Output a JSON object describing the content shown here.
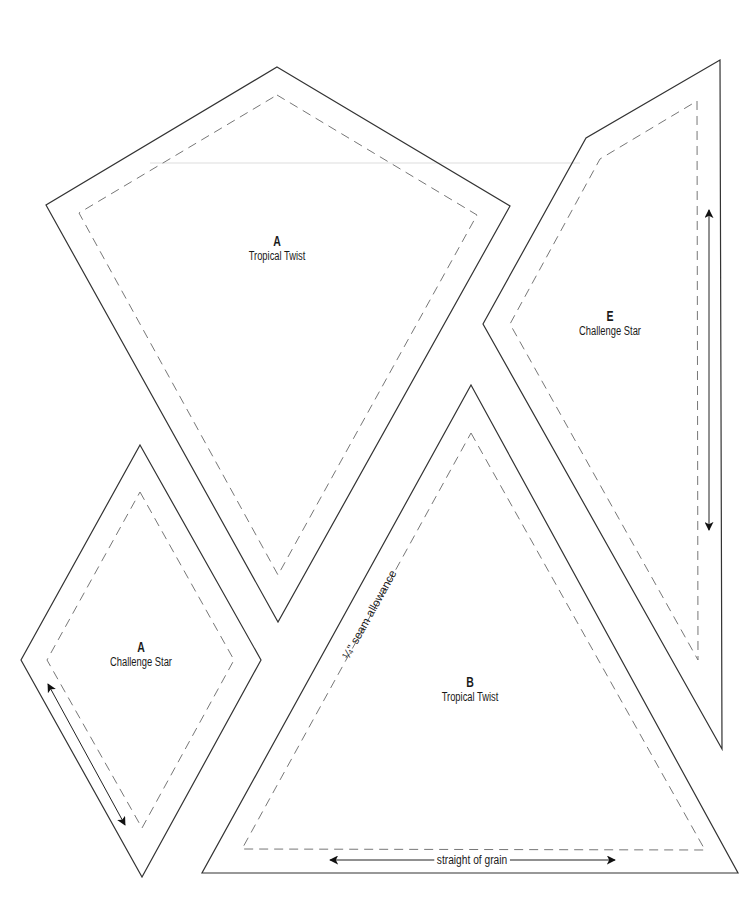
{
  "document": {
    "type": "quilt pattern template sheet",
    "colors": {
      "background": "#ffffff",
      "cut_line": "#333333",
      "seam_line": "#777777",
      "text": "#1a1a1a"
    }
  },
  "pieces": [
    {
      "id": "kite-a-tropical",
      "letter": "A",
      "name": "Tropical Twist",
      "cut_line": [
        [
          277,
          67
        ],
        [
          510,
          206
        ],
        [
          278,
          622
        ],
        [
          46,
          205
        ]
      ],
      "seam_line": [
        [
          277,
          95
        ],
        [
          477,
          215
        ],
        [
          278,
          575
        ],
        [
          79,
          213
        ]
      ],
      "label_pos": [
        277,
        238
      ]
    },
    {
      "id": "shape-e-challenge",
      "letter": "E",
      "name": "Challenge Star",
      "cut_line": [
        [
          720,
          60
        ],
        [
          722,
          749
        ],
        [
          483,
          324
        ],
        [
          586,
          138
        ]
      ],
      "seam_line": [
        [
          697,
          101
        ],
        [
          698,
          660
        ],
        [
          510,
          324
        ],
        [
          600,
          159
        ]
      ],
      "label_pos": [
        610,
        313
      ],
      "grain_arrow": [
        [
          709,
          210
        ],
        [
          709,
          530
        ]
      ]
    },
    {
      "id": "diamond-a-challenge",
      "letter": "A",
      "name": "Challenge Star",
      "cut_line": [
        [
          140,
          445
        ],
        [
          261,
          660
        ],
        [
          142,
          877
        ],
        [
          21,
          660
        ]
      ],
      "seam_line": [
        [
          140,
          492
        ],
        [
          234,
          660
        ],
        [
          142,
          828
        ],
        [
          47,
          660
        ]
      ],
      "label_pos": [
        141,
        640
      ],
      "grain_arrow": [
        [
          48,
          684
        ],
        [
          125,
          825
        ]
      ]
    },
    {
      "id": "triangle-b-tropical",
      "letter": "B",
      "name": "Tropical Twist",
      "cut_line": [
        [
          471,
          385
        ],
        [
          738,
          873
        ],
        [
          202,
          873
        ]
      ],
      "seam_line": [
        [
          471,
          433
        ],
        [
          705,
          850
        ],
        [
          242,
          849
        ]
      ],
      "label_pos": [
        470,
        677
      ],
      "grain_arrow": [
        [
          330,
          860
        ],
        [
          615,
          860
        ]
      ],
      "grain_label": "straight of grain",
      "seam_label": "¼\" seam allowance"
    }
  ]
}
